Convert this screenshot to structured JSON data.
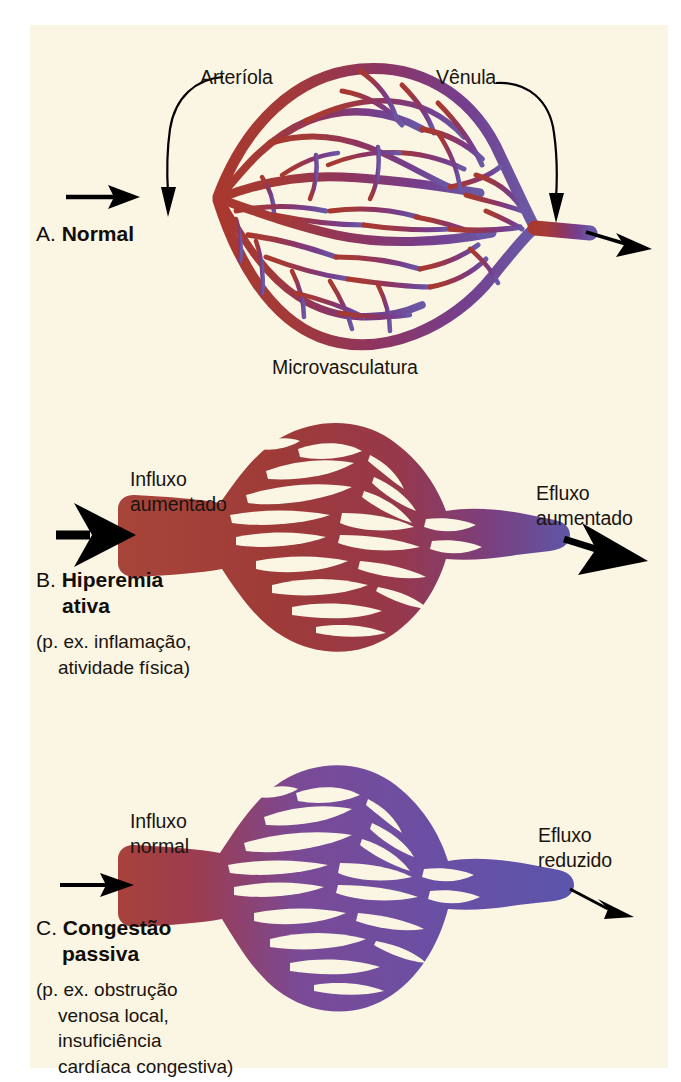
{
  "figure": {
    "background_color": "#fbf5e4",
    "page_color": "#ffffff",
    "text_color": "#19140f"
  },
  "colors": {
    "arteriole_red": "#a8382f",
    "mid_magenta": "#8e3560",
    "venule_purple": "#6a5aa6",
    "panel_b_red": "#9e3b38",
    "panel_c_purple": "#7a4a96",
    "arrow_black": "#000000"
  },
  "panels": [
    {
      "id": "a",
      "letter": "A.",
      "title": "Normal",
      "caption": [],
      "labels": {
        "arteriole": "Arteríola",
        "venule": "Vênula",
        "microvasculature": "Microvasculatura"
      },
      "inflow": "",
      "outflow": "",
      "inflow_magnitude": "normal",
      "outflow_magnitude": "normal",
      "bed_state": "normal gradient arteriole red to venule purple"
    },
    {
      "id": "b",
      "letter": "B.",
      "title": "Hiperemia",
      "title_line2": "ativa",
      "caption": [
        "(p. ex. inflamação,",
        "atividade física)"
      ],
      "labels": {
        "inflow_line1": "Influxo",
        "inflow_line2": "aumentado",
        "outflow_line1": "Efluxo",
        "outflow_line2": "aumentado"
      },
      "inflow_magnitude": "increased",
      "outflow_magnitude": "increased",
      "bed_state": "engorged oxygenated red bed"
    },
    {
      "id": "c",
      "letter": "C.",
      "title": "Congestão",
      "title_line2": "passiva",
      "caption": [
        "(p. ex. obstrução",
        "venosa local,",
        "insuficiência",
        "cardíaca congestiva)"
      ],
      "labels": {
        "inflow_line1": "Influxo",
        "inflow_line2": "normal",
        "outflow_line1": "Efluxo",
        "outflow_line2": "reduzido"
      },
      "inflow_magnitude": "normal",
      "outflow_magnitude": "reduced",
      "bed_state": "engorged deoxygenated purple-blue bed"
    }
  ]
}
